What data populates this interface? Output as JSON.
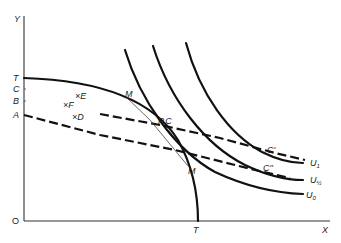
{
  "diagram": {
    "axes": {
      "y_label": "Y",
      "x_label": "X",
      "origin_label": "O",
      "y_ticks": [
        "T",
        "C",
        "B",
        "A"
      ],
      "x_ticks": [
        "T"
      ]
    },
    "points": [
      {
        "marker": "×",
        "label": "E"
      },
      {
        "marker": "×",
        "label": "F"
      },
      {
        "marker": "×",
        "label": "D"
      }
    ],
    "curve_labels": {
      "tangent_upper": "M",
      "tangent_lower": "M",
      "equilibrium": "P,C",
      "price_line_1": "C'",
      "price_line_2": "C''",
      "indifference": [
        {
          "base": "U",
          "sub": "1"
        },
        {
          "base": "U",
          "sub": "½"
        },
        {
          "base": "U",
          "sub": "0"
        }
      ]
    }
  }
}
